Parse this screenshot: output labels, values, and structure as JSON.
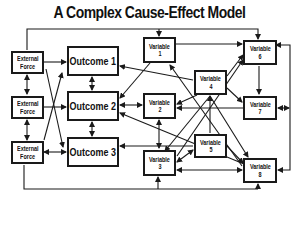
{
  "title": "A Complex Cause-Effect Model",
  "colors": {
    "line": "#1a1a1a",
    "background": "#ffffff",
    "text": "#111111"
  },
  "nodes": {
    "ef1": {
      "line1": "External",
      "line2": "Force"
    },
    "ef2": {
      "line1": "External",
      "line2": "Force"
    },
    "ef3": {
      "line1": "External",
      "line2": "Force"
    },
    "o1": {
      "label": "Outcome 1"
    },
    "o2": {
      "label": "Outcome 2"
    },
    "o3": {
      "label": "Outcome 3"
    },
    "v1": {
      "line1": "Variable",
      "line2": "1"
    },
    "v2": {
      "line1": "Variable",
      "line2": "2"
    },
    "v3": {
      "line1": "Variable",
      "line2": "3"
    },
    "v4": {
      "line1": "Variable",
      "line2": "4"
    },
    "v5": {
      "line1": "Variable",
      "line2": "5"
    },
    "v6": {
      "line1": "Variable",
      "line2": "6"
    },
    "v7": {
      "line1": "Variable",
      "line2": "7"
    },
    "v8": {
      "line1": "Variable",
      "line2": "8"
    }
  },
  "edges": [
    {
      "from": "top-bus",
      "to": "External Force 1"
    },
    {
      "from": "top-bus",
      "to": "Variable 1"
    },
    {
      "from": "top-bus",
      "to": "Variable 6"
    },
    {
      "from": "External Force 1",
      "to": "Outcome 1"
    },
    {
      "from": "External Force 1",
      "to": "External Force 2",
      "bidirectional": true
    },
    {
      "from": "External Force 2",
      "to": "External Force 3",
      "bidirectional": true
    },
    {
      "from": "External Force 2",
      "to": "Outcome 2"
    },
    {
      "from": "External Force 3",
      "to": "Outcome 3",
      "bidirectional": true
    },
    {
      "from": "External Force 3",
      "to": "Outcome 1"
    },
    {
      "from": "External Force 2",
      "to": "Outcome 3"
    },
    {
      "from": "Outcome 1",
      "to": "Outcome 2",
      "bidirectional": true
    },
    {
      "from": "Outcome 2",
      "to": "Outcome 3",
      "bidirectional": true
    },
    {
      "from": "Variable 1",
      "to": "Variable 6"
    },
    {
      "from": "Variable 1",
      "to": "Outcome 2"
    },
    {
      "from": "Variable 4",
      "to": "Outcome 1"
    },
    {
      "from": "Variable 2",
      "to": "Outcome 2",
      "bidirectional": true
    },
    {
      "from": "Variable 4",
      "to": "Variable 2"
    },
    {
      "from": "Variable 4",
      "to": "Variable 6"
    },
    {
      "from": "Variable 4",
      "to": "Variable 7"
    },
    {
      "from": "Variable 6",
      "to": "Variable 7"
    },
    {
      "from": "Variable 7",
      "to": "Variable 2"
    },
    {
      "from": "Variable 7",
      "to": "right-bus",
      "bidirectional": true
    },
    {
      "from": "right-bus",
      "to": "Variable 6"
    },
    {
      "from": "right-bus",
      "to": "Variable 8"
    },
    {
      "from": "Variable 2",
      "to": "Variable 3",
      "bidirectional": true
    },
    {
      "from": "Variable 5",
      "to": "Variable 4"
    },
    {
      "from": "Variable 5",
      "to": "Outcome 3"
    },
    {
      "from": "Variable 5",
      "to": "Variable 3",
      "bidirectional": true
    },
    {
      "from": "Variable 5",
      "to": "Variable 8"
    },
    {
      "from": "Variable 3",
      "to": "Variable 8",
      "bidirectional": true
    },
    {
      "from": "Variable 8",
      "to": "Outcome 2"
    },
    {
      "from": "Variable 3",
      "to": "Variable 6"
    },
    {
      "from": "Variable 8",
      "to": "Variable 1"
    },
    {
      "from": "External Force 3",
      "to": "bottom-bus"
    },
    {
      "from": "bottom-bus",
      "to": "Variable 3"
    },
    {
      "from": "bottom-bus",
      "to": "Variable 8"
    }
  ]
}
